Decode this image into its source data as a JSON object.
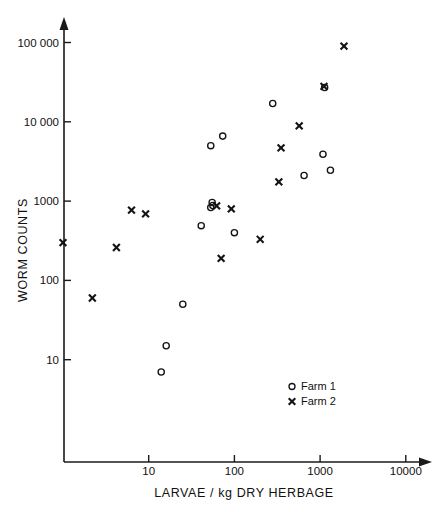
{
  "chart_data": {
    "type": "scatter",
    "title": "",
    "xlabel": "LARVAE / kg DRY HERBAGE",
    "ylabel": "WORM  COUNTS",
    "xscale": "log",
    "yscale": "log",
    "xlim": [
      1,
      10000
    ],
    "ylim": [
      1,
      100000
    ],
    "grid": false,
    "legend_position": "bottom-right",
    "xticks": [
      {
        "value": 10,
        "label": "10"
      },
      {
        "value": 100,
        "label": "100"
      },
      {
        "value": 1000,
        "label": "1000"
      },
      {
        "value": 10000,
        "label": "10000"
      }
    ],
    "yticks": [
      {
        "value": 10,
        "label": "10"
      },
      {
        "value": 100,
        "label": "100"
      },
      {
        "value": 1000,
        "label": "1000"
      },
      {
        "value": 10000,
        "label": "10 000"
      },
      {
        "value": 100000,
        "label": "100 000"
      }
    ],
    "series": [
      {
        "name": "Farm 1",
        "marker": "circle",
        "color": "#141414",
        "points": [
          {
            "x": 14,
            "y": 7
          },
          {
            "x": 16,
            "y": 15
          },
          {
            "x": 25,
            "y": 50
          },
          {
            "x": 41,
            "y": 490
          },
          {
            "x": 53,
            "y": 830
          },
          {
            "x": 55,
            "y": 960
          },
          {
            "x": 56,
            "y": 880
          },
          {
            "x": 53,
            "y": 5000
          },
          {
            "x": 73,
            "y": 6600
          },
          {
            "x": 100,
            "y": 400
          },
          {
            "x": 280,
            "y": 17000
          },
          {
            "x": 650,
            "y": 2100
          },
          {
            "x": 1080,
            "y": 3900
          },
          {
            "x": 1130,
            "y": 27000
          },
          {
            "x": 1320,
            "y": 2450
          }
        ]
      },
      {
        "name": "Farm 2",
        "marker": "cross",
        "color": "#141414",
        "points": [
          {
            "x": 1.0,
            "y": 300
          },
          {
            "x": 2.2,
            "y": 60
          },
          {
            "x": 4.2,
            "y": 260
          },
          {
            "x": 6.3,
            "y": 770
          },
          {
            "x": 9.2,
            "y": 690
          },
          {
            "x": 70,
            "y": 190
          },
          {
            "x": 62,
            "y": 870
          },
          {
            "x": 92,
            "y": 800
          },
          {
            "x": 200,
            "y": 330
          },
          {
            "x": 330,
            "y": 1750
          },
          {
            "x": 350,
            "y": 4700
          },
          {
            "x": 570,
            "y": 8900
          },
          {
            "x": 1110,
            "y": 28000
          },
          {
            "x": 1900,
            "y": 90000
          }
        ]
      }
    ],
    "legend": [
      {
        "marker": "circle",
        "label": "Farm 1"
      },
      {
        "marker": "cross",
        "label": "Farm 2"
      }
    ]
  },
  "axes": {
    "x_title": "LARVAE / kg DRY HERBAGE",
    "y_title": "WORM  COUNTS"
  }
}
